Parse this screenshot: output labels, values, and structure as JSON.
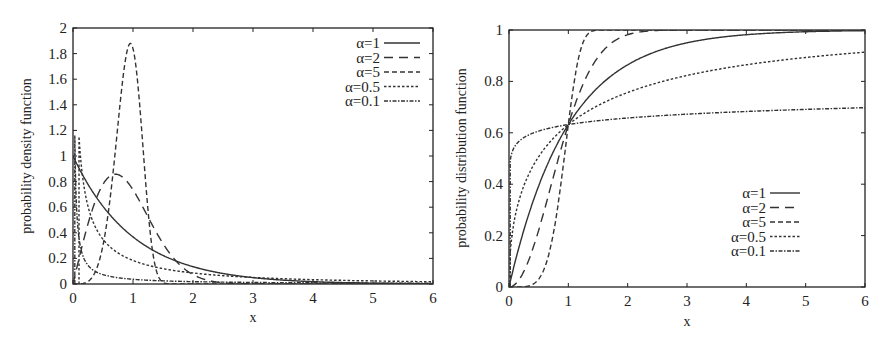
{
  "chart_data": [
    {
      "type": "line",
      "id": "pdf",
      "title": "",
      "xlabel": "x",
      "ylabel": "probability density function",
      "xlim": [
        0,
        6
      ],
      "ylim": [
        0,
        2
      ],
      "xticks": [
        0,
        1,
        2,
        3,
        4,
        5,
        6
      ],
      "yticks": [
        0,
        0.2,
        0.4,
        0.6,
        0.8,
        1,
        1.2,
        1.4,
        1.6,
        1.8,
        2
      ],
      "ytick_labels": [
        "0",
        "0.2",
        "0.4",
        "0.6",
        "0.8",
        "1",
        "1.2",
        "1.4",
        "1.6",
        "1.8",
        "2"
      ],
      "grid": false,
      "legend_position": "upper right",
      "plot_box": {
        "left": 73,
        "top": 28,
        "right": 433,
        "bottom": 284
      },
      "legend_box": {
        "text_right_x": 380,
        "first_y": 43,
        "row_h": 14.5,
        "line_x1": 384,
        "line_x2": 420
      },
      "function": "Weibull pdf f(x) = a * x^(a-1) * exp(-x^a), scale 1",
      "series": [
        {
          "name": "α=1",
          "alpha": 1,
          "dash": "",
          "x": [
            0,
            0.5,
            1,
            1.5,
            2,
            3,
            4,
            6
          ],
          "values": [
            1.0,
            0.61,
            0.37,
            0.22,
            0.14,
            0.05,
            0.02,
            0.0
          ]
        },
        {
          "name": "α=2",
          "alpha": 2,
          "dash": "9,6",
          "x": [
            0,
            0.25,
            0.5,
            0.71,
            1,
            1.5,
            2,
            3
          ],
          "values": [
            0.0,
            0.47,
            0.78,
            0.86,
            0.74,
            0.32,
            0.07,
            0.0
          ]
        },
        {
          "name": "α=5",
          "alpha": 5,
          "dash": "5,3",
          "x": [
            0,
            0.5,
            0.8,
            0.97,
            1,
            1.2,
            1.4,
            1.6
          ],
          "values": [
            0.0,
            0.3,
            1.4,
            1.88,
            1.84,
            0.86,
            0.09,
            0.0
          ]
        },
        {
          "name": "α=0.5",
          "alpha": 0.5,
          "dash": "2.5,2",
          "x": [
            0.1,
            0.25,
            0.5,
            1,
            2,
            3,
            6
          ],
          "values": [
            1.6,
            0.61,
            0.35,
            0.18,
            0.09,
            0.05,
            0.02
          ]
        },
        {
          "name": "α=0.1",
          "alpha": 0.1,
          "dash": "4,1.5,1.5,1.5",
          "x": [
            0.03,
            0.1,
            0.3,
            1,
            2,
            6
          ],
          "values": [
            0.6,
            0.24,
            0.08,
            0.04,
            0.02,
            0.01
          ]
        }
      ],
      "sampling": {
        "x_min": 0.03,
        "step": 0.01,
        "clip": [
          1.6,
          0.6
        ]
      }
    },
    {
      "type": "line",
      "id": "cdf",
      "title": "",
      "xlabel": "x",
      "ylabel": "probability distribution function",
      "xlim": [
        0,
        6
      ],
      "ylim": [
        0,
        1
      ],
      "xticks": [
        0,
        1,
        2,
        3,
        4,
        5,
        6
      ],
      "yticks": [
        0,
        0.2,
        0.4,
        0.6,
        0.8,
        1
      ],
      "ytick_labels": [
        "0",
        "0.2",
        "0.4",
        "0.6",
        "0.8",
        "1"
      ],
      "grid": false,
      "legend_position": "lower right",
      "plot_box": {
        "left": 509,
        "top": 30,
        "right": 865,
        "bottom": 287
      },
      "legend_box": {
        "text_right_x": 766,
        "first_y": 193,
        "row_h": 14.5,
        "line_x1": 770,
        "line_x2": 800
      },
      "function": "Weibull cdf F(x) = 1 - exp(-x^a), scale 1",
      "series": [
        {
          "name": "α=1",
          "alpha": 1,
          "dash": "",
          "x": [
            0,
            0.5,
            1,
            2,
            3,
            4,
            6
          ],
          "values": [
            0.0,
            0.39,
            0.63,
            0.86,
            0.95,
            0.98,
            1.0
          ]
        },
        {
          "name": "α=2",
          "alpha": 2,
          "dash": "9,6",
          "x": [
            0,
            0.5,
            1,
            1.5,
            2,
            3
          ],
          "values": [
            0.0,
            0.22,
            0.63,
            0.89,
            0.98,
            1.0
          ]
        },
        {
          "name": "α=5",
          "alpha": 5,
          "dash": "5,3",
          "x": [
            0,
            0.5,
            0.8,
            1,
            1.2,
            1.4
          ],
          "values": [
            0.0,
            0.03,
            0.28,
            0.63,
            0.92,
            1.0
          ]
        },
        {
          "name": "α=0.5",
          "alpha": 0.5,
          "dash": "2.5,2",
          "x": [
            0,
            0.25,
            0.5,
            1,
            2,
            4,
            6
          ],
          "values": [
            0.0,
            0.39,
            0.51,
            0.63,
            0.76,
            0.86,
            0.91
          ]
        },
        {
          "name": "α=0.1",
          "alpha": 0.1,
          "dash": "4,1.5,1.5,1.5",
          "x": [
            0.02,
            0.1,
            0.5,
            1,
            2,
            6
          ],
          "values": [
            0.54,
            0.57,
            0.61,
            0.63,
            0.66,
            0.69
          ]
        }
      ],
      "sampling": {
        "x_min": 0.02,
        "step": 0.01
      }
    }
  ],
  "charts": {
    "left": {
      "xlabel": "x",
      "ylabel": "probability density function"
    },
    "right": {
      "xlabel": "x",
      "ylabel": "probability distribution function"
    }
  },
  "colors": {
    "axis": "#222222",
    "line": "#333333",
    "background": "#ffffff"
  }
}
